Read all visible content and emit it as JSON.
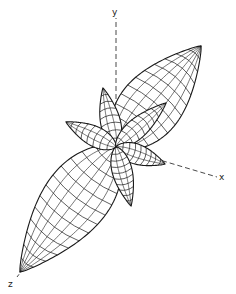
{
  "diagram": {
    "type": "3d-lobe-pattern",
    "origin": [
      116,
      147
    ],
    "stroke_color": "#1a1a1a",
    "background": "#ffffff",
    "axes": [
      {
        "name": "y",
        "label": "y",
        "from": [
          116,
          147
        ],
        "to": [
          116,
          18
        ],
        "label_pos": [
          112,
          8
        ]
      },
      {
        "name": "x",
        "label": "x",
        "from": [
          116,
          147
        ],
        "to": [
          217,
          177
        ],
        "label_pos": [
          219,
          173
        ]
      },
      {
        "name": "z",
        "label": "z",
        "from": [
          116,
          147
        ],
        "to": [
          17,
          277
        ],
        "label_pos": [
          8,
          280
        ]
      }
    ],
    "lobes": [
      {
        "name": "main-lobe-upper-right",
        "tip": [
          201,
          46
        ],
        "length": 135,
        "width": 62,
        "rings": 11,
        "meridians": 6
      },
      {
        "name": "main-lobe-lower-left",
        "tip": [
          20,
          272
        ],
        "length": 158,
        "width": 66,
        "rings": 12,
        "meridians": 6
      },
      {
        "name": "side-lobe-up",
        "tip": [
          103,
          88
        ],
        "length": 62,
        "width": 20,
        "rings": 7,
        "meridians": 3
      },
      {
        "name": "side-lobe-left",
        "tip": [
          66,
          122
        ],
        "length": 56,
        "width": 20,
        "rings": 7,
        "meridians": 3
      },
      {
        "name": "side-lobe-upper-right",
        "tip": [
          166,
          103
        ],
        "length": 67,
        "width": 20,
        "rings": 8,
        "meridians": 3
      },
      {
        "name": "side-lobe-right",
        "tip": [
          165,
          164
        ],
        "length": 52,
        "width": 20,
        "rings": 8,
        "meridians": 3
      },
      {
        "name": "side-lobe-down",
        "tip": [
          131,
          206
        ],
        "length": 61,
        "width": 20,
        "rings": 9,
        "meridians": 3
      }
    ]
  }
}
